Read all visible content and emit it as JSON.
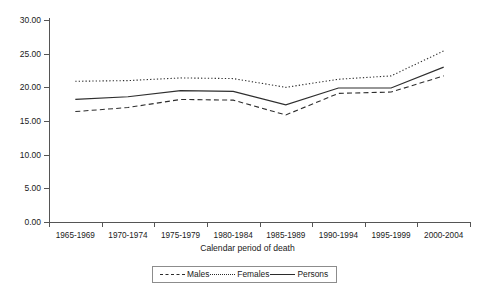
{
  "chart_data": {
    "type": "line",
    "title": "",
    "xlabel": "Calendar period of death",
    "ylabel": "",
    "categories": [
      "1965-1969",
      "1970-1974",
      "1975-1979",
      "1980-1984",
      "1985-1989",
      "1990-1994",
      "1995-1999",
      "2000-2004"
    ],
    "ylim": [
      0,
      30
    ],
    "ytick_labels": [
      "30.00",
      "25.00",
      "20.00",
      "15.00",
      "10.00",
      "5.00",
      "0.00"
    ],
    "ytick_values": [
      30,
      25,
      20,
      15,
      10,
      5,
      0
    ],
    "grid": false,
    "legend_position": "bottom-center",
    "series": [
      {
        "name": "Males",
        "style": "dashed",
        "values": [
          16.4,
          17.0,
          18.2,
          18.1,
          15.9,
          19.1,
          19.3,
          21.7
        ]
      },
      {
        "name": "Females",
        "style": "dotted",
        "values": [
          20.9,
          21.0,
          21.4,
          21.3,
          20.0,
          21.2,
          21.7,
          25.4
        ]
      },
      {
        "name": "Persons",
        "style": "solid",
        "values": [
          18.2,
          18.6,
          19.5,
          19.4,
          17.4,
          19.9,
          19.9,
          23.0
        ]
      }
    ]
  },
  "axis": {
    "x_title": "Calendar period of death"
  },
  "legend": {
    "items": [
      {
        "label": "Males",
        "style": "dashed"
      },
      {
        "label": "Females",
        "style": "dotted"
      },
      {
        "label": "Persons",
        "style": "solid"
      }
    ]
  }
}
